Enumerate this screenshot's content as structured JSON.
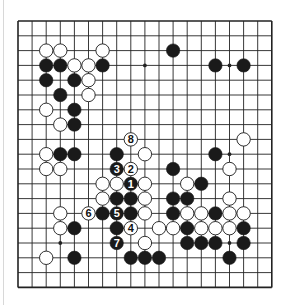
{
  "board": {
    "size": 19,
    "origin_x": 18,
    "origin_y": 21,
    "spacing_x": 14.1,
    "spacing_y": 14.8,
    "line_color": "#222222",
    "background": "#ffffff",
    "black_color": "#1a1a1a",
    "white_color": "#ffffff",
    "star_points": [
      [
        3,
        3
      ],
      [
        9,
        3
      ],
      [
        15,
        3
      ],
      [
        3,
        9
      ],
      [
        9,
        9
      ],
      [
        15,
        9
      ],
      [
        3,
        15
      ],
      [
        9,
        15
      ],
      [
        15,
        15
      ]
    ]
  },
  "stones": [
    {
      "col": 2,
      "row": 2,
      "color": "white"
    },
    {
      "col": 3,
      "row": 2,
      "color": "white"
    },
    {
      "col": 6,
      "row": 2,
      "color": "white"
    },
    {
      "col": 11,
      "row": 2,
      "color": "black"
    },
    {
      "col": 2,
      "row": 3,
      "color": "black"
    },
    {
      "col": 3,
      "row": 3,
      "color": "black"
    },
    {
      "col": 4,
      "row": 3,
      "color": "white"
    },
    {
      "col": 5,
      "row": 3,
      "color": "white"
    },
    {
      "col": 6,
      "row": 3,
      "color": "black"
    },
    {
      "col": 14,
      "row": 3,
      "color": "black"
    },
    {
      "col": 16,
      "row": 3,
      "color": "black"
    },
    {
      "col": 2,
      "row": 4,
      "color": "black"
    },
    {
      "col": 4,
      "row": 4,
      "color": "black"
    },
    {
      "col": 5,
      "row": 4,
      "color": "white"
    },
    {
      "col": 3,
      "row": 5,
      "color": "black"
    },
    {
      "col": 5,
      "row": 5,
      "color": "white"
    },
    {
      "col": 2,
      "row": 6,
      "color": "white"
    },
    {
      "col": 4,
      "row": 6,
      "color": "black"
    },
    {
      "col": 3,
      "row": 7,
      "color": "white"
    },
    {
      "col": 4,
      "row": 7,
      "color": "black"
    },
    {
      "col": 8,
      "row": 8,
      "color": "white",
      "label": "8"
    },
    {
      "col": 16,
      "row": 8,
      "color": "white"
    },
    {
      "col": 2,
      "row": 9,
      "color": "white"
    },
    {
      "col": 3,
      "row": 9,
      "color": "black"
    },
    {
      "col": 4,
      "row": 9,
      "color": "black"
    },
    {
      "col": 7,
      "row": 9,
      "color": "black"
    },
    {
      "col": 9,
      "row": 9,
      "color": "white"
    },
    {
      "col": 14,
      "row": 9,
      "color": "black"
    },
    {
      "col": 2,
      "row": 10,
      "color": "white"
    },
    {
      "col": 3,
      "row": 10,
      "color": "white"
    },
    {
      "col": 7,
      "row": 10,
      "color": "black",
      "label": "3"
    },
    {
      "col": 8,
      "row": 10,
      "color": "white",
      "label": "2"
    },
    {
      "col": 11,
      "row": 10,
      "color": "black"
    },
    {
      "col": 15,
      "row": 10,
      "color": "white"
    },
    {
      "col": 6,
      "row": 11,
      "color": "white"
    },
    {
      "col": 7,
      "row": 11,
      "color": "white"
    },
    {
      "col": 8,
      "row": 11,
      "color": "black",
      "label": "1"
    },
    {
      "col": 9,
      "row": 11,
      "color": "white"
    },
    {
      "col": 12,
      "row": 11,
      "color": "white"
    },
    {
      "col": 13,
      "row": 11,
      "color": "black"
    },
    {
      "col": 6,
      "row": 12,
      "color": "white"
    },
    {
      "col": 7,
      "row": 12,
      "color": "black"
    },
    {
      "col": 8,
      "row": 12,
      "color": "black"
    },
    {
      "col": 9,
      "row": 12,
      "color": "white"
    },
    {
      "col": 11,
      "row": 12,
      "color": "black"
    },
    {
      "col": 12,
      "row": 12,
      "color": "black"
    },
    {
      "col": 15,
      "row": 12,
      "color": "white"
    },
    {
      "col": 3,
      "row": 13,
      "color": "white"
    },
    {
      "col": 5,
      "row": 13,
      "color": "white",
      "label": "6"
    },
    {
      "col": 6,
      "row": 13,
      "color": "black"
    },
    {
      "col": 7,
      "row": 13,
      "color": "black",
      "label": "5"
    },
    {
      "col": 8,
      "row": 13,
      "color": "black"
    },
    {
      "col": 9,
      "row": 13,
      "color": "white"
    },
    {
      "col": 11,
      "row": 13,
      "color": "black"
    },
    {
      "col": 12,
      "row": 13,
      "color": "white"
    },
    {
      "col": 13,
      "row": 13,
      "color": "white"
    },
    {
      "col": 14,
      "row": 13,
      "color": "black"
    },
    {
      "col": 15,
      "row": 13,
      "color": "white"
    },
    {
      "col": 16,
      "row": 13,
      "color": "white"
    },
    {
      "col": 3,
      "row": 14,
      "color": "white"
    },
    {
      "col": 4,
      "row": 14,
      "color": "black"
    },
    {
      "col": 7,
      "row": 14,
      "color": "black"
    },
    {
      "col": 8,
      "row": 14,
      "color": "white",
      "label": "4"
    },
    {
      "col": 10,
      "row": 14,
      "color": "white"
    },
    {
      "col": 11,
      "row": 14,
      "color": "white"
    },
    {
      "col": 12,
      "row": 14,
      "color": "black"
    },
    {
      "col": 13,
      "row": 14,
      "color": "white"
    },
    {
      "col": 14,
      "row": 14,
      "color": "white"
    },
    {
      "col": 15,
      "row": 14,
      "color": "white"
    },
    {
      "col": 16,
      "row": 14,
      "color": "black"
    },
    {
      "col": 7,
      "row": 15,
      "color": "black",
      "label": "7"
    },
    {
      "col": 9,
      "row": 15,
      "color": "white"
    },
    {
      "col": 12,
      "row": 15,
      "color": "black"
    },
    {
      "col": 13,
      "row": 15,
      "color": "black"
    },
    {
      "col": 14,
      "row": 15,
      "color": "black"
    },
    {
      "col": 16,
      "row": 15,
      "color": "black"
    },
    {
      "col": 2,
      "row": 16,
      "color": "white"
    },
    {
      "col": 4,
      "row": 16,
      "color": "black"
    },
    {
      "col": 8,
      "row": 16,
      "color": "black"
    },
    {
      "col": 9,
      "row": 16,
      "color": "black"
    },
    {
      "col": 10,
      "row": 16,
      "color": "black"
    },
    {
      "col": 15,
      "row": 16,
      "color": "black"
    }
  ]
}
